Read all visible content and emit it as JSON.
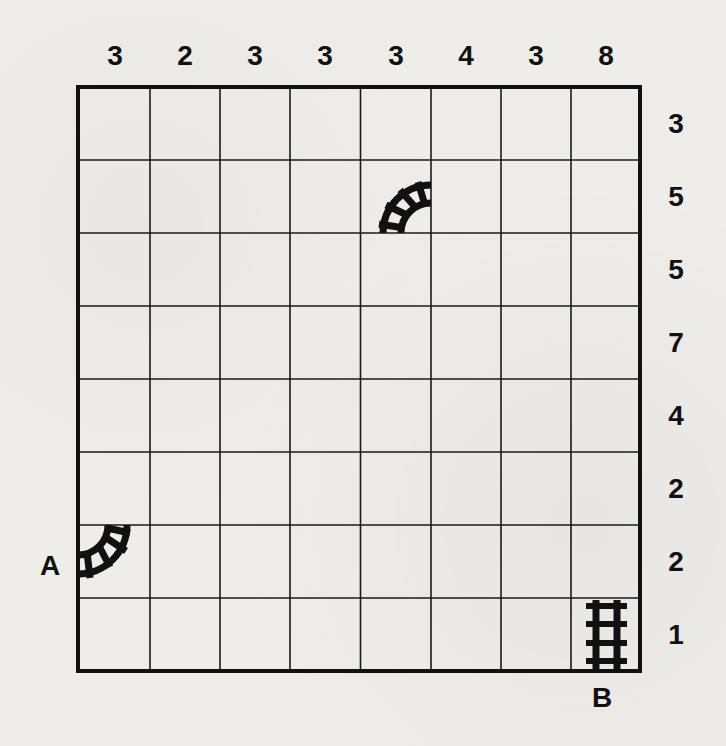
{
  "puzzle": {
    "type": "train-tracks",
    "rows": 8,
    "cols": 8,
    "column_clues": [
      "3",
      "2",
      "3",
      "3",
      "3",
      "4",
      "3",
      "8"
    ],
    "row_clues": [
      "3",
      "5",
      "5",
      "7",
      "4",
      "2",
      "2",
      "1"
    ],
    "start_label": "A",
    "end_label": "B",
    "start_position": {
      "row": 7,
      "col": 1,
      "side": "left"
    },
    "end_position": {
      "row": 8,
      "col": 8,
      "side": "bottom"
    },
    "given_pieces": [
      {
        "row": 2,
        "col": 5,
        "piece": "curve",
        "connects": [
          "bottom",
          "right"
        ],
        "icon": "curved-track-icon"
      },
      {
        "row": 7,
        "col": 1,
        "piece": "curve",
        "connects": [
          "left",
          "top"
        ],
        "icon": "curved-track-icon"
      },
      {
        "row": 8,
        "col": 8,
        "piece": "straight",
        "connects": [
          "top",
          "bottom"
        ],
        "icon": "straight-track-icon"
      }
    ]
  },
  "colors": {
    "background": "#eeede9",
    "ink": "#111111",
    "grid_line": "#1a1a1a"
  }
}
